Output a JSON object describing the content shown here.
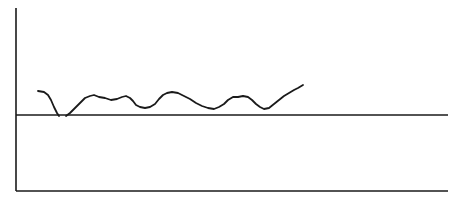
{
  "diagram": {
    "stroke_color": "#1a1a1a",
    "background": "#ffffff",
    "y_axis": {
      "x": 16,
      "y1": 8,
      "y2": 191
    },
    "x_axis": {
      "y": 191,
      "x1": 16,
      "x2": 448
    },
    "reference_line": {
      "y": 115,
      "x1": 16,
      "x2": 448
    },
    "curve_segments": [
      [
        [
          38,
          91
        ],
        [
          44,
          92
        ],
        [
          48,
          95
        ],
        [
          51,
          100
        ],
        [
          54,
          107
        ],
        [
          57,
          113
        ],
        [
          59,
          116
        ]
      ],
      [
        [
          66,
          116
        ],
        [
          70,
          113
        ],
        [
          75,
          108
        ],
        [
          80,
          103
        ],
        [
          85,
          98
        ],
        [
          90,
          96
        ],
        [
          94,
          95
        ],
        [
          99,
          97
        ],
        [
          105,
          98
        ],
        [
          111,
          100
        ],
        [
          117,
          99
        ],
        [
          122,
          97
        ],
        [
          126,
          96
        ],
        [
          130,
          98
        ],
        [
          133,
          101
        ],
        [
          136,
          105
        ],
        [
          140,
          107
        ],
        [
          145,
          108
        ],
        [
          150,
          107
        ],
        [
          155,
          104
        ],
        [
          159,
          99
        ],
        [
          163,
          95
        ],
        [
          167,
          93
        ],
        [
          172,
          92
        ],
        [
          178,
          93
        ],
        [
          184,
          96
        ],
        [
          190,
          99
        ],
        [
          196,
          103
        ],
        [
          202,
          106
        ],
        [
          208,
          108
        ],
        [
          214,
          109
        ],
        [
          219,
          107
        ],
        [
          224,
          104
        ],
        [
          228,
          100
        ],
        [
          233,
          97
        ],
        [
          238,
          97
        ],
        [
          243,
          96
        ],
        [
          248,
          97
        ],
        [
          252,
          100
        ],
        [
          256,
          104
        ],
        [
          260,
          107
        ],
        [
          264,
          109
        ],
        [
          269,
          108
        ],
        [
          274,
          104
        ],
        [
          279,
          100
        ],
        [
          284,
          96
        ],
        [
          289,
          93
        ],
        [
          294,
          90
        ],
        [
          298,
          88
        ],
        [
          303,
          85
        ]
      ]
    ]
  }
}
